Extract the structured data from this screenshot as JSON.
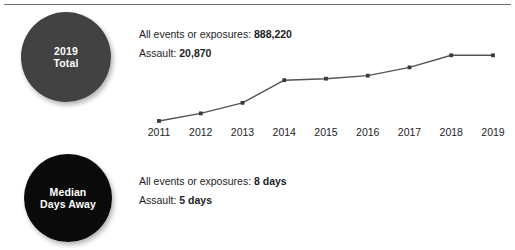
{
  "divider": {
    "name": "top-rule"
  },
  "badges": [
    {
      "id": "total",
      "line1": "2019",
      "line2": "Total",
      "color": "#424242"
    },
    {
      "id": "median",
      "line1": "Median",
      "line2": "Days Away",
      "color": "#0a0a0a"
    }
  ],
  "stats_total": {
    "rows": [
      {
        "label": "All events or exposures: ",
        "value": "888,220"
      },
      {
        "label": "Assault: ",
        "value": "20,870"
      }
    ]
  },
  "stats_median": {
    "rows": [
      {
        "label": "All events or exposures: ",
        "value": "8 days"
      },
      {
        "label": "Assault: ",
        "value": "5 days"
      }
    ]
  },
  "chart_data": {
    "type": "line",
    "title": "",
    "subtitle": "",
    "xlabel": "",
    "ylabel": "",
    "grid": false,
    "legend": null,
    "categories": [
      "2011",
      "2012",
      "2013",
      "2014",
      "2015",
      "2016",
      "2017",
      "2018",
      "2019"
    ],
    "series": [
      {
        "name": "Assault events",
        "color": "#545458",
        "values": [
          14200,
          15200,
          16600,
          19600,
          19800,
          20200,
          21300,
          22900,
          22900
        ]
      }
    ],
    "ylim": [
      13000,
      23600
    ],
    "marker": "square",
    "axis_line": false
  }
}
